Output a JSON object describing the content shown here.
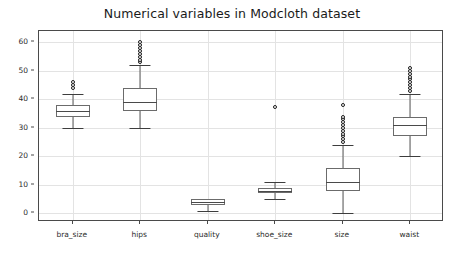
{
  "chart_data": {
    "type": "box",
    "title": "Numerical variables in Modcloth dataset",
    "xlabel": "",
    "ylabel": "",
    "categories": [
      "bra_size",
      "hips",
      "quality",
      "shoe_size",
      "size",
      "waist"
    ],
    "ylim": [
      -3,
      64
    ],
    "yticks": [
      0,
      10,
      20,
      30,
      40,
      50,
      60
    ],
    "ytick_labels": [
      "0",
      "10",
      "20",
      "30",
      "40",
      "50",
      "60"
    ],
    "grid": true,
    "legend": "none",
    "boxes": [
      {
        "name": "bra_size",
        "whisker_low": 30,
        "q1": 34,
        "median": 36,
        "q3": 38,
        "whisker_high": 42,
        "fliers": [
          44,
          45,
          46
        ]
      },
      {
        "name": "hips",
        "whisker_low": 30,
        "q1": 36,
        "median": 39,
        "q3": 44,
        "whisker_high": 52,
        "fliers": [
          53,
          54,
          55,
          56,
          57,
          58,
          59,
          60
        ]
      },
      {
        "name": "quality",
        "whisker_low": 1,
        "q1": 3,
        "median": 4,
        "q3": 5,
        "whisker_high": 5,
        "fliers": []
      },
      {
        "name": "shoe_size",
        "whisker_low": 5,
        "q1": 7,
        "median": 8,
        "q3": 9,
        "whisker_high": 11,
        "fliers": [
          37.5
        ]
      },
      {
        "name": "size",
        "whisker_low": 0,
        "q1": 8,
        "median": 11,
        "q3": 16,
        "whisker_high": 24,
        "fliers": [
          25,
          26,
          27,
          28,
          29,
          30,
          31,
          32,
          33,
          34,
          38
        ]
      },
      {
        "name": "waist",
        "whisker_low": 20,
        "q1": 27,
        "median": 31,
        "q3": 34,
        "whisker_high": 42,
        "fliers": [
          43,
          44,
          45,
          46,
          47,
          48,
          49,
          50,
          51
        ]
      }
    ]
  },
  "colors": {
    "box_edge": "#6b6b6b",
    "median": "#4a4a4a",
    "whisker": "#5c5c5c",
    "flier_edge": "#1c1c1c",
    "grid": "#e3e3e3",
    "axis": "#4a4a4a",
    "text": "#2b2b2b",
    "background": "#ffffff"
  }
}
